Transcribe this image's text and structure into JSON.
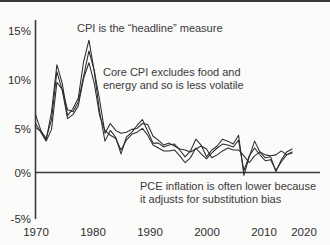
{
  "chart_data": {
    "type": "line",
    "title": "",
    "subtitle": "",
    "xlabel": "",
    "ylabel": "",
    "xlim": [
      1970,
      2020
    ],
    "ylim": [
      -5,
      15
    ],
    "grid": false,
    "legend_position": "none",
    "y_tick_labels": [
      "15%",
      "10%",
      "5%",
      "0%",
      "-5%"
    ],
    "y_tick_values": [
      15,
      10,
      5,
      0,
      -5
    ],
    "x_tick_labels": [
      "1970",
      "1980",
      "1990",
      "2000",
      "2010",
      "2020"
    ],
    "x_tick_values": [
      1970,
      1980,
      1990,
      2000,
      2010,
      2020
    ],
    "x": [
      1970,
      1971,
      1972,
      1973,
      1974,
      1975,
      1976,
      1977,
      1978,
      1979,
      1980,
      1981,
      1982,
      1983,
      1984,
      1985,
      1986,
      1987,
      1988,
      1989,
      1990,
      1991,
      1992,
      1993,
      1994,
      1995,
      1996,
      1997,
      1998,
      1999,
      2000,
      2001,
      2002,
      2003,
      2004,
      2005,
      2006,
      2007,
      2008,
      2009,
      2010,
      2011,
      2012,
      2013,
      2014,
      2015,
      2016,
      2017,
      2018
    ],
    "series": [
      {
        "name": "CPI",
        "color": "#2b2b2b",
        "values": [
          5.9,
          4.3,
          3.3,
          6.2,
          11.0,
          9.1,
          5.8,
          6.5,
          7.6,
          11.3,
          13.5,
          10.3,
          6.2,
          3.2,
          4.3,
          3.6,
          1.9,
          3.6,
          4.1,
          4.8,
          5.4,
          4.2,
          3.0,
          3.0,
          2.6,
          2.8,
          2.9,
          2.3,
          1.6,
          2.2,
          3.4,
          2.8,
          1.6,
          2.3,
          2.7,
          3.4,
          3.2,
          2.9,
          3.8,
          -0.3,
          1.6,
          3.2,
          2.1,
          1.5,
          1.6,
          0.1,
          1.3,
          2.1,
          2.4
        ]
      },
      {
        "name": "Core CPI",
        "color": "#2b2b2b",
        "values": [
          5.0,
          4.1,
          3.2,
          4.4,
          9.2,
          8.5,
          6.4,
          6.2,
          7.2,
          9.8,
          12.4,
          10.4,
          7.4,
          4.0,
          5.0,
          4.3,
          4.0,
          4.1,
          4.4,
          4.5,
          5.0,
          4.9,
          3.7,
          3.3,
          2.8,
          3.0,
          2.7,
          2.4,
          2.3,
          2.1,
          2.4,
          2.7,
          2.4,
          1.5,
          1.8,
          2.2,
          2.5,
          2.3,
          2.3,
          1.7,
          1.0,
          1.7,
          2.1,
          1.8,
          1.7,
          1.8,
          2.2,
          1.8,
          2.1
        ]
      },
      {
        "name": "PCE",
        "color": "#2b2b2b",
        "values": [
          4.6,
          4.2,
          3.5,
          5.4,
          10.3,
          8.4,
          5.5,
          5.9,
          6.8,
          9.6,
          11.2,
          9.1,
          5.8,
          4.3,
          3.8,
          3.5,
          2.3,
          3.3,
          3.9,
          4.1,
          4.5,
          3.8,
          2.8,
          2.5,
          2.2,
          2.2,
          2.3,
          1.7,
          1.0,
          1.5,
          2.5,
          1.9,
          1.4,
          2.0,
          2.5,
          2.9,
          2.8,
          2.6,
          3.3,
          0.2,
          1.7,
          2.5,
          1.8,
          1.2,
          1.3,
          0.2,
          1.1,
          1.8,
          2.0
        ]
      }
    ],
    "annotations": [
      {
        "id": "cpi-note",
        "text": "CPI is the “headline” measure"
      },
      {
        "id": "core-note-line1",
        "text": "Core CPI excludes food and"
      },
      {
        "id": "core-note-line2",
        "text": "energy and so is less volatile"
      },
      {
        "id": "pce-note-line1",
        "text": "PCE inflation is often lower because"
      },
      {
        "id": "pce-note-line2",
        "text": "it adjusts for substitution bias"
      }
    ]
  },
  "axis": {
    "y": {
      "t15": "15%",
      "t10": "10%",
      "t5": "5%",
      "t0": "0%",
      "tm5": "-5%"
    },
    "x": {
      "t1970": "1970",
      "t1980": "1980",
      "t1990": "1990",
      "t2000": "2000",
      "t2010": "2010",
      "t2020": "2020"
    }
  },
  "annotations": {
    "cpi": "CPI is the “headline” measure",
    "core_l1": "Core CPI excludes food and",
    "core_l2": "energy and so is less volatile",
    "pce_l1": "PCE inflation is often lower because",
    "pce_l2": "it adjusts for substitution bias"
  },
  "colors": {
    "line": "#2b2b2b",
    "axis": "#3a3a3a",
    "background": "#fbfbfa",
    "text": "#2e2e2e"
  }
}
